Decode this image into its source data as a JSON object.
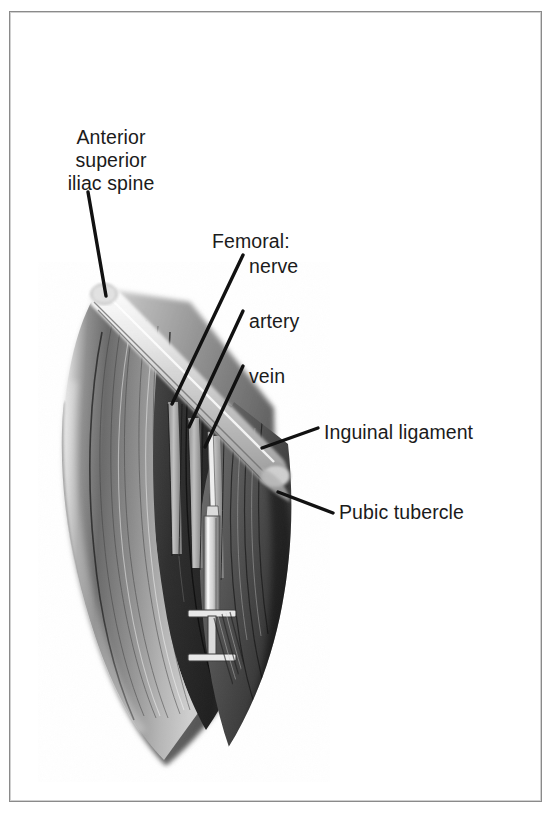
{
  "figure": {
    "kind": "anatomical-illustration",
    "frame_border_color": "#8a8a8a",
    "background_color": "#ffffff",
    "text_color": "#1b1b1b",
    "leader_line_color": "#111111"
  },
  "labels": {
    "asis": "Anterior\nsuperior\niliac spine",
    "femoral_group": "Femoral:",
    "nerve": "nerve",
    "artery": "artery",
    "vein": "vein",
    "inguinal_ligament": "Inguinal ligament",
    "pubic_tubercle": "Pubic tubercle"
  },
  "leader_lines": [
    {
      "name": "asis-leader",
      "x1": 88,
      "y1": 192,
      "x2": 106,
      "y2": 296
    },
    {
      "name": "femoral-nerve-leader",
      "x1": 243,
      "y1": 255,
      "x2": 172,
      "y2": 404
    },
    {
      "name": "femoral-artery-leader",
      "x1": 243,
      "y1": 311,
      "x2": 189,
      "y2": 427
    },
    {
      "name": "femoral-vein-leader",
      "x1": 243,
      "y1": 366,
      "x2": 205,
      "y2": 447
    },
    {
      "name": "inguinal-ligament-leader",
      "x1": 318,
      "y1": 428,
      "x2": 262,
      "y2": 448
    },
    {
      "name": "pubic-tubercle-leader",
      "x1": 333,
      "y1": 513,
      "x2": 278,
      "y2": 492
    }
  ],
  "illustration_parts": [
    {
      "name": "inguinal-ligament-band",
      "description": "pale diagonal ligament band running from upper-left iliac spine to lower-right pubic tubercle"
    },
    {
      "name": "sartorius-muscle",
      "description": "large shaded muscle belly on the left of the femoral triangle"
    },
    {
      "name": "adductor-muscle-mass",
      "description": "dark shaded muscle mass on the right of the femoral triangle"
    },
    {
      "name": "femoral-nerve-structure",
      "description": "vertical cord lateral to the artery"
    },
    {
      "name": "femoral-artery-structure",
      "description": "vertical vessel medial to the nerve"
    },
    {
      "name": "femoral-vein-structure",
      "description": "vertical vessel medial to the artery, target of the needle"
    },
    {
      "name": "syringe",
      "description": "syringe with needle inserted into the femoral vein below the inguinal ligament"
    },
    {
      "name": "syringe-needle",
      "description": "thin needle shaft entering the vein"
    },
    {
      "name": "syringe-barrel",
      "description": "syringe barrel"
    },
    {
      "name": "syringe-finger-flange",
      "description": "finger flange of the syringe"
    },
    {
      "name": "syringe-plunger",
      "description": "plunger rod and thumb rest"
    }
  ]
}
